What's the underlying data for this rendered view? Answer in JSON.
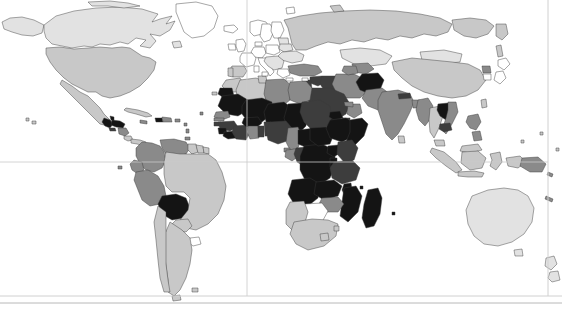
{
  "map": {
    "type": "choropleth",
    "title": "",
    "projection": "equirectangular",
    "background_color": "#ffffff",
    "border_color": "#3a3a3a",
    "graticule_color": "#c9c9c9",
    "frame_color": "#d0d0d0",
    "view_box": "0 0 562 309",
    "graticules": {
      "meridians": [
        {
          "label": "prime-meridian",
          "x": 247
        }
      ],
      "parallels": [
        {
          "label": "equator",
          "y": 162
        }
      ]
    },
    "frame": {
      "bottom_lines_y": [
        296,
        303
      ],
      "right_line_x": 548
    },
    "legend_visible": false,
    "scale": {
      "levels": [
        {
          "name": "none",
          "color": "#ffffff"
        },
        {
          "name": "very-low",
          "color": "#e2e2e2"
        },
        {
          "name": "low",
          "color": "#c8c8c8"
        },
        {
          "name": "medium",
          "color": "#8a8a8a"
        },
        {
          "name": "high",
          "color": "#3d3d3d"
        },
        {
          "name": "very-high",
          "color": "#141414"
        }
      ]
    },
    "regions": [
      {
        "name": "greenland",
        "level": "none"
      },
      {
        "name": "canada",
        "level": "very-low"
      },
      {
        "name": "alaska",
        "level": "very-low"
      },
      {
        "name": "united-states",
        "level": "low"
      },
      {
        "name": "mexico",
        "level": "low"
      },
      {
        "name": "guatemala",
        "level": "very-high"
      },
      {
        "name": "honduras",
        "level": "very-high"
      },
      {
        "name": "nicaragua",
        "level": "medium"
      },
      {
        "name": "el-salvador",
        "level": "high"
      },
      {
        "name": "costa-rica",
        "level": "low"
      },
      {
        "name": "panama",
        "level": "low"
      },
      {
        "name": "cuba",
        "level": "low"
      },
      {
        "name": "haiti",
        "level": "very-high"
      },
      {
        "name": "dominican-republic",
        "level": "medium"
      },
      {
        "name": "jamaica",
        "level": "medium"
      },
      {
        "name": "colombia",
        "level": "medium"
      },
      {
        "name": "venezuela",
        "level": "medium"
      },
      {
        "name": "guyana",
        "level": "low"
      },
      {
        "name": "suriname",
        "level": "low"
      },
      {
        "name": "ecuador",
        "level": "medium"
      },
      {
        "name": "peru",
        "level": "medium"
      },
      {
        "name": "bolivia",
        "level": "very-high"
      },
      {
        "name": "brazil",
        "level": "low"
      },
      {
        "name": "paraguay",
        "level": "low"
      },
      {
        "name": "uruguay",
        "level": "none"
      },
      {
        "name": "argentina",
        "level": "low"
      },
      {
        "name": "chile",
        "level": "low"
      },
      {
        "name": "iceland",
        "level": "none"
      },
      {
        "name": "united-kingdom",
        "level": "none"
      },
      {
        "name": "ireland",
        "level": "none"
      },
      {
        "name": "norway",
        "level": "none"
      },
      {
        "name": "sweden",
        "level": "none"
      },
      {
        "name": "finland",
        "level": "none"
      },
      {
        "name": "france",
        "level": "none"
      },
      {
        "name": "spain",
        "level": "low"
      },
      {
        "name": "portugal",
        "level": "low"
      },
      {
        "name": "germany",
        "level": "none"
      },
      {
        "name": "poland",
        "level": "none"
      },
      {
        "name": "italy",
        "level": "none"
      },
      {
        "name": "greece",
        "level": "none"
      },
      {
        "name": "balkans",
        "level": "very-low"
      },
      {
        "name": "ukraine",
        "level": "very-low"
      },
      {
        "name": "belarus",
        "level": "very-low"
      },
      {
        "name": "russia",
        "level": "low"
      },
      {
        "name": "turkey",
        "level": "medium"
      },
      {
        "name": "syria",
        "level": "high"
      },
      {
        "name": "iraq",
        "level": "high"
      },
      {
        "name": "iran",
        "level": "medium"
      },
      {
        "name": "saudi-arabia",
        "level": "high"
      },
      {
        "name": "yemen",
        "level": "very-high"
      },
      {
        "name": "oman",
        "level": "medium"
      },
      {
        "name": "afghanistan",
        "level": "very-high"
      },
      {
        "name": "pakistan",
        "level": "medium"
      },
      {
        "name": "india",
        "level": "medium"
      },
      {
        "name": "nepal",
        "level": "high"
      },
      {
        "name": "bangladesh",
        "level": "medium"
      },
      {
        "name": "sri-lanka",
        "level": "low"
      },
      {
        "name": "kazakhstan",
        "level": "very-low"
      },
      {
        "name": "uzbekistan",
        "level": "medium"
      },
      {
        "name": "mongolia",
        "level": "very-low"
      },
      {
        "name": "china",
        "level": "low"
      },
      {
        "name": "japan",
        "level": "none"
      },
      {
        "name": "south-korea",
        "level": "none"
      },
      {
        "name": "north-korea",
        "level": "medium"
      },
      {
        "name": "myanmar",
        "level": "medium"
      },
      {
        "name": "thailand",
        "level": "low"
      },
      {
        "name": "laos",
        "level": "very-high"
      },
      {
        "name": "vietnam",
        "level": "medium"
      },
      {
        "name": "cambodia",
        "level": "high"
      },
      {
        "name": "malaysia",
        "level": "low"
      },
      {
        "name": "indonesia",
        "level": "low"
      },
      {
        "name": "philippines",
        "level": "medium"
      },
      {
        "name": "papua-new-guinea",
        "level": "medium"
      },
      {
        "name": "australia",
        "level": "very-low"
      },
      {
        "name": "new-zealand",
        "level": "very-low"
      },
      {
        "name": "morocco",
        "level": "low"
      },
      {
        "name": "algeria",
        "level": "low"
      },
      {
        "name": "tunisia",
        "level": "low"
      },
      {
        "name": "libya",
        "level": "medium"
      },
      {
        "name": "egypt",
        "level": "medium"
      },
      {
        "name": "sudan",
        "level": "high"
      },
      {
        "name": "south-sudan",
        "level": "very-high"
      },
      {
        "name": "eritrea",
        "level": "very-high"
      },
      {
        "name": "ethiopia",
        "level": "very-high"
      },
      {
        "name": "somalia",
        "level": "very-high"
      },
      {
        "name": "djibouti",
        "level": "high"
      },
      {
        "name": "mauritania",
        "level": "very-high"
      },
      {
        "name": "mali",
        "level": "very-high"
      },
      {
        "name": "niger",
        "level": "very-high"
      },
      {
        "name": "chad",
        "level": "very-high"
      },
      {
        "name": "senegal",
        "level": "medium"
      },
      {
        "name": "gambia",
        "level": "medium"
      },
      {
        "name": "guinea-bissau",
        "level": "high"
      },
      {
        "name": "guinea",
        "level": "high"
      },
      {
        "name": "sierra-leone",
        "level": "very-high"
      },
      {
        "name": "liberia",
        "level": "very-high"
      },
      {
        "name": "ivory-coast",
        "level": "high"
      },
      {
        "name": "burkina-faso",
        "level": "very-high"
      },
      {
        "name": "ghana",
        "level": "medium"
      },
      {
        "name": "togo",
        "level": "high"
      },
      {
        "name": "benin",
        "level": "high"
      },
      {
        "name": "nigeria",
        "level": "high"
      },
      {
        "name": "cameroon",
        "level": "medium"
      },
      {
        "name": "central-african-republic",
        "level": "very-high"
      },
      {
        "name": "gabon",
        "level": "medium"
      },
      {
        "name": "congo",
        "level": "high"
      },
      {
        "name": "dr-congo",
        "level": "very-high"
      },
      {
        "name": "uganda",
        "level": "very-high"
      },
      {
        "name": "kenya",
        "level": "high"
      },
      {
        "name": "rwanda",
        "level": "very-high"
      },
      {
        "name": "burundi",
        "level": "very-high"
      },
      {
        "name": "tanzania",
        "level": "high"
      },
      {
        "name": "angola",
        "level": "very-high"
      },
      {
        "name": "zambia",
        "level": "very-high"
      },
      {
        "name": "malawi",
        "level": "very-high"
      },
      {
        "name": "mozambique",
        "level": "very-high"
      },
      {
        "name": "zimbabwe",
        "level": "medium"
      },
      {
        "name": "botswana",
        "level": "none"
      },
      {
        "name": "namibia",
        "level": "low"
      },
      {
        "name": "south-africa",
        "level": "low"
      },
      {
        "name": "lesotho",
        "level": "low"
      },
      {
        "name": "madagascar",
        "level": "very-high"
      }
    ]
  }
}
